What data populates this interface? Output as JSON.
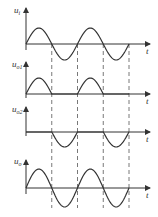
{
  "diagram": {
    "type": "waveform-timing-diagram",
    "time_label": "t",
    "panels": [
      {
        "name": "input",
        "label_main": "u",
        "label_sub": "i",
        "waveform": "sine",
        "baseline_y": 44,
        "amplitude": 16
      },
      {
        "name": "output-1",
        "label_main": "u",
        "label_sub": "o1",
        "waveform": "positive-half",
        "baseline_y": 94,
        "amplitude": 16
      },
      {
        "name": "output-2",
        "label_main": "u",
        "label_sub": "o2",
        "waveform": "negative-half",
        "baseline_y": 132,
        "amplitude": 15
      },
      {
        "name": "output",
        "label_main": "u",
        "label_sub": "o",
        "waveform": "sine",
        "baseline_y": 188,
        "amplitude": 19
      }
    ],
    "origin_x": 26,
    "half_period_px": 25.75,
    "half_cycles": 4,
    "zero_crossings_x": [
      51.75,
      77.5,
      103.25,
      129
    ],
    "colors": {
      "line": "#333333",
      "dash": "#555555"
    }
  }
}
